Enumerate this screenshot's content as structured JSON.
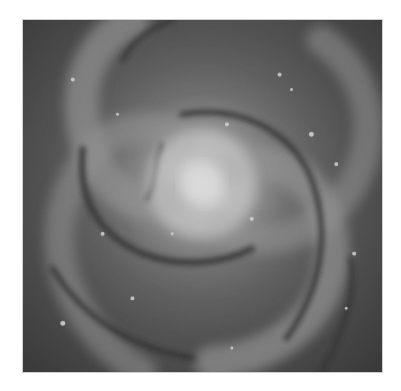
{
  "image": {
    "subject": "spiral galaxy",
    "description": "Grayscale photograph of a face-on spiral galaxy with a bright central core, winding dust lanes and bright star-forming clusters along the arms",
    "colors": {
      "background": "#ffffff",
      "core": "#f4f4f4",
      "arms": "#8a8a8a",
      "dust_lanes": "#1c1c1c",
      "outer": "#222222"
    }
  }
}
